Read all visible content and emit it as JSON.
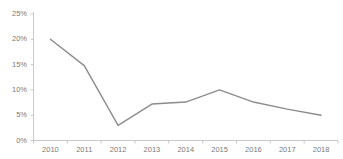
{
  "chart_data": {
    "type": "line",
    "title": "",
    "xlabel": "",
    "ylabel": "",
    "categories": [
      "2010",
      "2011",
      "2012",
      "2013",
      "2014",
      "2015",
      "2016",
      "2017",
      "2018"
    ],
    "values": [
      20.0,
      14.8,
      3.0,
      7.2,
      7.6,
      10.0,
      7.6,
      6.2,
      5.0
    ],
    "series": [
      {
        "name": "",
        "values": [
          20.0,
          14.8,
          3.0,
          7.2,
          7.6,
          10.0,
          7.6,
          6.2,
          5.0
        ],
        "color": "#8c8c8c"
      }
    ],
    "ylim": [
      0,
      25
    ],
    "ytick_labels": [
      "0%",
      "5%",
      "10%",
      "15%",
      "20%",
      "25%"
    ],
    "ytick_values": [
      0,
      5,
      10,
      15,
      20,
      25
    ],
    "grid": false,
    "legend": false,
    "markers": false,
    "value_suffix": "%"
  },
  "style": {
    "line_color": "#8c8c8c",
    "axis_color": "#c9c9c9",
    "label_color": "#7a7a7a",
    "background": "#ffffff"
  }
}
